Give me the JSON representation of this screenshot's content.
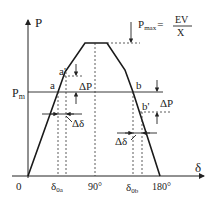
{
  "diagram": {
    "y_axis_label": "P",
    "x_axis_label": "δ",
    "pm_label": "P",
    "pm_sub": "m",
    "pmax_label": "P",
    "pmax_sub": "max",
    "pmax_eq": "=",
    "pmax_num": "EV",
    "pmax_den": "X",
    "point_a": "a",
    "point_a_prime": "a'",
    "point_b": "b",
    "point_b_prime": "b'",
    "delta_p_left": "ΔP",
    "delta_p_right": "ΔP",
    "delta_delta_left": "Δδ",
    "delta_delta_right": "Δδ",
    "ticks": [
      {
        "id": "origin",
        "text": "0"
      },
      {
        "id": "d0a",
        "text": "δ",
        "sub": "0a"
      },
      {
        "id": "d90",
        "text": "90°"
      },
      {
        "id": "d0b",
        "text": "δ",
        "sub": "0b"
      },
      {
        "id": "d180",
        "text": "180°"
      }
    ]
  }
}
